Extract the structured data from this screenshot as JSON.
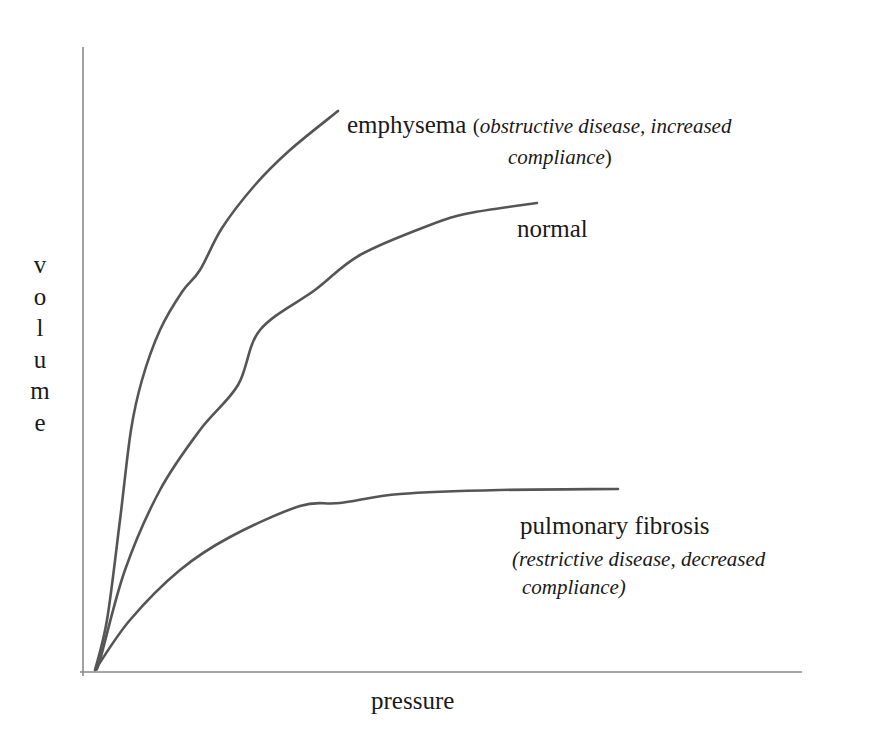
{
  "chart_data": {
    "type": "line",
    "title": "",
    "xlabel": "pressure",
    "ylabel": "volume",
    "grid": false,
    "legend": "none (curves labelled directly)",
    "axes": {
      "origin_px": [
        94,
        672
      ],
      "y_axis": {
        "x": 83,
        "top": 47,
        "bottom": 676,
        "color": "#8a8a8a"
      },
      "x_axis": {
        "y": 672,
        "left": 80,
        "right": 802,
        "color": "#8a8a8a"
      }
    },
    "series": [
      {
        "name": "emphysema",
        "annotation": "obstructive disease, increased compliance",
        "color": "#555555",
        "points_px": [
          [
            95,
            670
          ],
          [
            107,
            620
          ],
          [
            120,
            520
          ],
          [
            131,
            430
          ],
          [
            142,
            380
          ],
          [
            160,
            330
          ],
          [
            182,
            292
          ],
          [
            200,
            270
          ],
          [
            222,
            228
          ],
          [
            255,
            185
          ],
          [
            290,
            150
          ],
          [
            338,
            111
          ]
        ]
      },
      {
        "name": "normal",
        "annotation": "",
        "color": "#555555",
        "points_px": [
          [
            96,
            668
          ],
          [
            100,
            660
          ],
          [
            125,
            570
          ],
          [
            160,
            490
          ],
          [
            200,
            430
          ],
          [
            238,
            385
          ],
          [
            260,
            330
          ],
          [
            315,
            290
          ],
          [
            360,
            255
          ],
          [
            430,
            225
          ],
          [
            470,
            213
          ],
          [
            537,
            203
          ]
        ]
      },
      {
        "name": "pulmonary fibrosis",
        "annotation": "restrictive disease, decreased compliance",
        "color": "#555555",
        "points_px": [
          [
            97,
            667
          ],
          [
            130,
            620
          ],
          [
            180,
            570
          ],
          [
            230,
            537
          ],
          [
            300,
            506
          ],
          [
            340,
            503
          ],
          [
            400,
            494
          ],
          [
            500,
            490
          ],
          [
            618,
            489
          ]
        ]
      }
    ]
  },
  "labels": {
    "emphysema": {
      "name": "emphysema",
      "open": "(",
      "note_line1": "obstructive disease, increased",
      "note_line2": "compliance",
      "close": ")"
    },
    "normal": {
      "name": "normal"
    },
    "fibrosis": {
      "name": "pulmonary fibrosis",
      "note_line1": "(restrictive disease, decreased",
      "note_line2": "compliance)"
    }
  },
  "axis_labels": {
    "x": "pressure",
    "y_letters": [
      "v",
      "o",
      "l",
      "u",
      "m",
      "e"
    ]
  }
}
